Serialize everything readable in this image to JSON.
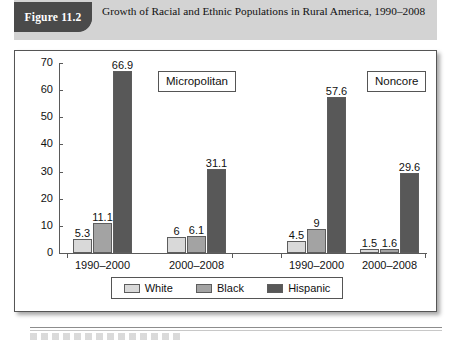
{
  "figure": {
    "tag": "Figure 11.2",
    "caption": "Growth of Racial and Ethnic Populations in Rural America, 1990–2008"
  },
  "chart_data": {
    "type": "bar",
    "title": "Growth of Racial and Ethnic Populations in Rural America, 1990–2008",
    "xlabel": "",
    "ylabel": "",
    "ylim": [
      0,
      70
    ],
    "yticks": [
      0,
      10,
      20,
      30,
      40,
      50,
      60,
      70
    ],
    "grid": false,
    "legend_position": "bottom",
    "legend": [
      "White",
      "Black",
      "Hispanic"
    ],
    "panels": [
      {
        "name": "Micropolitan",
        "categories": [
          "1990–2000",
          "2000–2008"
        ],
        "series": [
          {
            "name": "White",
            "values": [
              5.3,
              6
            ]
          },
          {
            "name": "Black",
            "values": [
              11.1,
              6.1
            ]
          },
          {
            "name": "Hispanic",
            "values": [
              66.9,
              31.1
            ]
          }
        ]
      },
      {
        "name": "Noncore",
        "categories": [
          "1990–2000",
          "2000–2008"
        ],
        "series": [
          {
            "name": "White",
            "values": [
              4.5,
              1.5
            ]
          },
          {
            "name": "Black",
            "values": [
              9,
              1.6
            ]
          },
          {
            "name": "Hispanic",
            "values": [
              57.6,
              29.6
            ]
          }
        ]
      }
    ],
    "colors": {
      "White": "#d9d9d9",
      "Black": "#a3a3a3",
      "Hispanic": "#585858",
      "bar_border": "#5d5d5d",
      "axis": "#5a5a5a",
      "banner": "#d3d3d3",
      "tag": "#4a4a4a"
    }
  }
}
